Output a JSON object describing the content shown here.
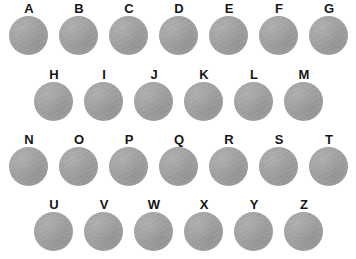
{
  "figure": {
    "background_color": "#ffffff",
    "circle_color": "#a2a2a2",
    "label_color": "#161616",
    "circle_diameter_px": 39,
    "column_spacing_px": 50,
    "row_spacing_px": 66
  },
  "rows": [
    {
      "row_index": 1,
      "offset_x": 9,
      "offset_y": 2,
      "cells": [
        {
          "label": "A"
        },
        {
          "label": "B"
        },
        {
          "label": "C"
        },
        {
          "label": "D"
        },
        {
          "label": "E"
        },
        {
          "label": "F"
        },
        {
          "label": "G"
        }
      ]
    },
    {
      "row_index": 2,
      "offset_x": 34,
      "offset_y": 68,
      "cells": [
        {
          "label": "H"
        },
        {
          "label": "I"
        },
        {
          "label": "J"
        },
        {
          "label": "K"
        },
        {
          "label": "L"
        },
        {
          "label": "M"
        }
      ]
    },
    {
      "row_index": 3,
      "offset_x": 9,
      "offset_y": 133,
      "cells": [
        {
          "label": "N"
        },
        {
          "label": "O"
        },
        {
          "label": "P"
        },
        {
          "label": "Q"
        },
        {
          "label": "R"
        },
        {
          "label": "S"
        },
        {
          "label": "T"
        }
      ]
    },
    {
      "row_index": 4,
      "offset_x": 34,
      "offset_y": 198,
      "cells": [
        {
          "label": "U"
        },
        {
          "label": "V"
        },
        {
          "label": "W"
        },
        {
          "label": "X"
        },
        {
          "label": "Y"
        },
        {
          "label": "Z"
        }
      ]
    }
  ]
}
